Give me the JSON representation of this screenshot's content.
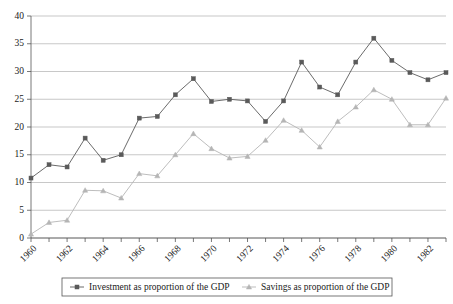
{
  "chart_data": {
    "type": "line",
    "title": "",
    "subtitle": "",
    "xlabel": "",
    "ylabel": "",
    "xlim": [
      1960,
      1983
    ],
    "ylim": [
      0,
      40
    ],
    "yticks": [
      0,
      5,
      10,
      15,
      20,
      25,
      30,
      35,
      40
    ],
    "ytick_labels": [
      "0",
      "5",
      "10",
      "15",
      "20",
      "25",
      "30",
      "35",
      "40"
    ],
    "x": [
      1960,
      1961,
      1962,
      1963,
      1964,
      1965,
      1966,
      1967,
      1968,
      1969,
      1970,
      1971,
      1972,
      1973,
      1974,
      1975,
      1976,
      1977,
      1978,
      1979,
      1980,
      1981,
      1982,
      1983
    ],
    "xtick_labels": [
      "1960",
      "1962",
      "1964",
      "1966",
      "1968",
      "1970",
      "1972",
      "1974",
      "1976",
      "1978",
      "1980",
      "1982"
    ],
    "xtick_values": [
      1960,
      1962,
      1964,
      1966,
      1968,
      1970,
      1972,
      1974,
      1976,
      1978,
      1980,
      1982
    ],
    "grid": true,
    "grid_axis": "y",
    "legend_position": "bottom",
    "series": [
      {
        "name": "Investment as proportion of the GDP",
        "color": "#5a5a5a",
        "marker": "square",
        "values": [
          10.8,
          13.2,
          12.8,
          18.0,
          14.0,
          15.0,
          21.6,
          21.9,
          25.8,
          28.7,
          24.6,
          25.0,
          24.7,
          21.0,
          24.7,
          31.7,
          27.2,
          25.8,
          31.7,
          36.0,
          32.0,
          29.8,
          28.5,
          29.8
        ]
      },
      {
        "name": "Savings as proportion of the GDP",
        "color": "#b5b5b5",
        "marker": "triangle",
        "values": [
          0.7,
          2.8,
          3.2,
          8.6,
          8.5,
          7.2,
          11.6,
          11.2,
          15.0,
          18.8,
          16.1,
          14.4,
          14.7,
          17.6,
          21.2,
          19.4,
          16.4,
          21.0,
          23.6,
          26.7,
          25.0,
          20.4,
          20.4,
          25.2
        ]
      }
    ]
  },
  "legend": {
    "items": [
      {
        "label": "Investment as proportion of the GDP"
      },
      {
        "label": "Savings as proportion of the GDP"
      }
    ]
  },
  "colors": {
    "investment": "#5a5a5a",
    "savings": "#b5b5b5",
    "grid": "#b0b0b0",
    "axis": "#555555",
    "text": "#1a1a1a",
    "background": "#ffffff"
  }
}
